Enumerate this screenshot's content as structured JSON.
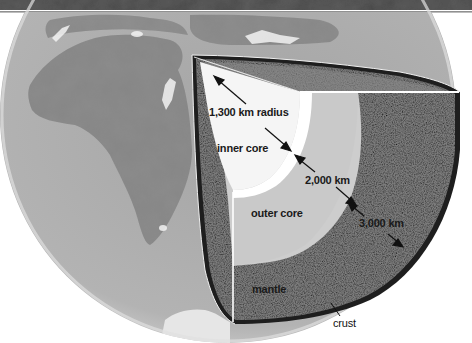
{
  "diagram": {
    "labels": {
      "inner_core_radius": "1,300 km radius",
      "inner_core": "inner core",
      "outer_core_thickness": "2,000 km",
      "outer_core": "outer core",
      "mantle_thickness": "3,000 km",
      "mantle": "mantle",
      "crust": "crust"
    },
    "layers": [
      {
        "name": "inner core",
        "measure": "1,300 km radius",
        "color": "#f4f4f4"
      },
      {
        "name": "outer core",
        "measure": "2,000 km",
        "color": "#cdcdcd"
      },
      {
        "name": "mantle",
        "measure": "3,000 km",
        "color": "#7c7c7c"
      },
      {
        "name": "crust",
        "color": "#1e1e1e"
      }
    ],
    "colors": {
      "top_band": "#4a4a4a",
      "ocean": "#b5b5b5",
      "land": "#8a8a8a",
      "background": "#ffffff"
    }
  }
}
